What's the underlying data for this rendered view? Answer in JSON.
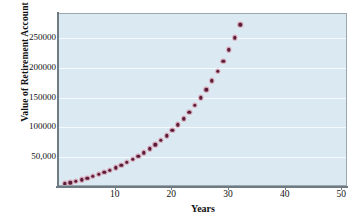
{
  "chart_data": {
    "type": "scatter",
    "title": "",
    "xlabel": "Years",
    "ylabel": "Value of Retirement Account",
    "xlim": [
      0,
      51
    ],
    "ylim": [
      0,
      290000
    ],
    "grid": true,
    "legend_position": "none",
    "marker_color": "#5b1c3a",
    "plot_background": "#dbe9f2",
    "gridline_color": "#f4fafd",
    "axis_color": "#6f7b82",
    "xticks": [
      10,
      20,
      30,
      40,
      50
    ],
    "xtick_labels": [
      "10",
      "20",
      "30",
      "40",
      "50"
    ],
    "yticks": [
      50000,
      100000,
      150000,
      200000,
      250000
    ],
    "ytick_labels": [
      "50,000",
      "100000",
      "150000",
      "200000",
      "250000"
    ],
    "series": [
      {
        "name": "Retirement account value",
        "x": [
          1,
          2,
          3,
          4,
          5,
          6,
          7,
          8,
          9,
          10,
          11,
          12,
          13,
          14,
          15,
          16,
          17,
          18,
          19,
          20,
          21,
          22,
          23,
          24,
          25,
          26,
          27,
          28,
          29,
          30,
          31,
          32,
          33,
          34,
          35,
          36,
          37,
          38,
          39,
          40,
          41,
          42,
          43,
          44,
          45,
          46,
          47,
          48,
          49,
          50
        ],
        "y": [
          2000,
          4160,
          6493,
          9012,
          11733,
          14672,
          17846,
          21274,
          24976,
          28974,
          33291,
          37953,
          42988,
          48427,
          54300,
          60644,
          67496,
          74895,
          82887,
          91518,
          100840,
          110907,
          121779,
          133520,
          146199,
          159895,
          174688,
          190670,
          207937,
          226597,
          246764,
          268566,
          292131,
          317612,
          345161,
          374946,
          407142,
          441945,
          479560,
          520211,
          564130,
          611561,
          662785,
          718100,
          777828,
          842255,
          911836,
          987000,
          1068200,
          1155900
        ]
      }
    ]
  },
  "axis": {
    "ylabel_text": "Value of Retirement Account",
    "xlabel_text": "Years"
  }
}
